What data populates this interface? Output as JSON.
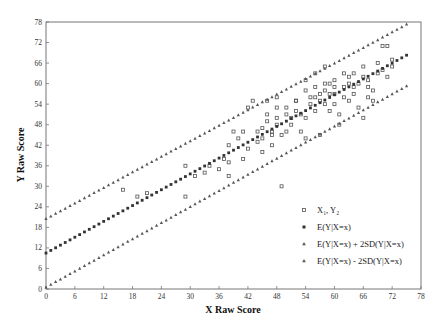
{
  "chart_data": {
    "type": "scatter",
    "title": "",
    "xlabel": "X Raw Score",
    "ylabel": "Y Raw Score",
    "xlim": [
      0,
      78
    ],
    "ylim": [
      0,
      78
    ],
    "xticks": [
      0,
      6,
      12,
      18,
      24,
      30,
      36,
      42,
      48,
      54,
      60,
      66,
      72,
      78
    ],
    "yticks": [
      0,
      6,
      12,
      18,
      24,
      30,
      36,
      42,
      48,
      54,
      60,
      66,
      72,
      78
    ],
    "grid": false,
    "legend_position": "lower right",
    "legend": [
      {
        "label": "X₁, Y₂",
        "marker": "open-square"
      },
      {
        "label": "E(Y|X=x)",
        "marker": "filled-square"
      },
      {
        "label": "E(Y|X=x) + 2SD(Y|X=x)",
        "marker": "triangle"
      },
      {
        "label": "E(Y|X=x) - 2SD(Y|X=x)",
        "marker": "triangle"
      }
    ],
    "series": [
      {
        "name": "X₁, Y₂",
        "marker": "open-square",
        "points": [
          [
            16,
            29
          ],
          [
            19,
            27
          ],
          [
            21,
            28
          ],
          [
            29,
            27
          ],
          [
            29,
            36
          ],
          [
            31,
            33
          ],
          [
            33,
            34
          ],
          [
            34,
            36
          ],
          [
            36,
            35
          ],
          [
            37,
            38
          ],
          [
            38,
            42
          ],
          [
            38,
            37
          ],
          [
            38,
            33
          ],
          [
            39,
            46
          ],
          [
            40,
            44
          ],
          [
            41,
            46
          ],
          [
            41,
            38
          ],
          [
            42,
            41
          ],
          [
            42,
            53
          ],
          [
            43,
            55
          ],
          [
            44,
            43
          ],
          [
            44,
            46
          ],
          [
            45,
            44
          ],
          [
            45,
            47
          ],
          [
            45,
            40
          ],
          [
            46,
            51
          ],
          [
            46,
            55
          ],
          [
            46,
            49
          ],
          [
            47,
            45
          ],
          [
            47,
            46
          ],
          [
            47,
            42
          ],
          [
            48,
            48
          ],
          [
            48,
            53
          ],
          [
            48,
            56
          ],
          [
            48,
            50
          ],
          [
            49,
            30
          ],
          [
            49,
            45
          ],
          [
            50,
            46
          ],
          [
            50,
            51
          ],
          [
            50,
            53
          ],
          [
            51,
            48
          ],
          [
            51,
            50
          ],
          [
            52,
            55
          ],
          [
            52,
            55
          ],
          [
            52,
            52
          ],
          [
            53,
            51
          ],
          [
            53,
            46
          ],
          [
            54,
            50
          ],
          [
            54,
            44
          ],
          [
            54,
            58
          ],
          [
            55,
            54
          ],
          [
            55,
            56
          ],
          [
            56,
            52
          ],
          [
            56,
            56
          ],
          [
            56,
            59
          ],
          [
            57,
            55
          ],
          [
            57,
            57
          ],
          [
            57,
            45
          ],
          [
            58,
            58
          ],
          [
            58,
            60
          ],
          [
            58,
            54
          ],
          [
            59,
            52
          ],
          [
            59,
            57
          ],
          [
            59,
            60
          ],
          [
            60,
            57
          ],
          [
            60,
            54
          ],
          [
            60,
            59
          ],
          [
            60,
            61
          ],
          [
            61,
            48
          ],
          [
            61,
            51
          ],
          [
            62,
            63
          ],
          [
            62,
            59
          ],
          [
            62,
            56
          ],
          [
            63,
            60
          ],
          [
            63,
            55
          ],
          [
            63,
            62
          ],
          [
            64,
            57
          ],
          [
            64,
            59
          ],
          [
            64,
            63
          ],
          [
            65,
            53
          ],
          [
            65,
            60
          ],
          [
            66,
            65
          ],
          [
            66,
            62
          ],
          [
            66,
            50
          ],
          [
            67,
            56
          ],
          [
            67,
            61
          ],
          [
            67,
            59
          ],
          [
            68,
            58
          ],
          [
            68,
            55
          ],
          [
            69,
            63
          ],
          [
            69,
            66
          ],
          [
            70,
            71
          ],
          [
            70,
            64
          ],
          [
            71,
            71
          ],
          [
            71,
            62
          ],
          [
            72,
            67
          ],
          [
            72,
            65
          ],
          [
            54,
            61
          ],
          [
            56,
            63
          ],
          [
            58,
            65
          ]
        ]
      },
      {
        "name": "E(Y|X=x)",
        "marker": "filled-square",
        "x_start": 0,
        "x_end": 75,
        "y_start": 10.5,
        "y_end": 68.3
      },
      {
        "name": "E(Y|X=x) + 2SD(Y|X=x)",
        "marker": "triangle",
        "x_start": 0,
        "x_end": 75,
        "y_start": 20.5,
        "y_end": 77.3
      },
      {
        "name": "E(Y|X=x) - 2SD(Y|X=x)",
        "marker": "triangle",
        "x_start": 0,
        "x_end": 75,
        "y_start": 0.5,
        "y_end": 59.3
      }
    ]
  },
  "labels": {
    "xlabel": "X Raw Score",
    "ylabel": "Y Raw Score",
    "legend": [
      "X₁, Y₂",
      "E(Y|X=x)",
      "E(Y|X=x) + 2SD(Y|X=x)",
      "E(Y|X=x) - 2SD(Y|X=x)"
    ]
  },
  "colors": {
    "axis": "#555555",
    "marker": "#555555",
    "filled_marker": "#333333"
  }
}
